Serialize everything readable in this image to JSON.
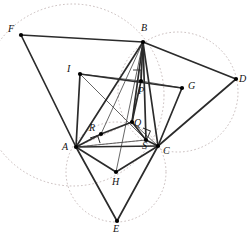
{
  "figure": {
    "background": "#ffffff",
    "stroke_solid": "#2b2b2b",
    "stroke_thin": "#4a4a4a",
    "stroke_dashed": "#b9a9a9",
    "vertex_fill": "#000000"
  },
  "points": [
    {
      "id": "F",
      "label": "F",
      "x": 21,
      "y": 35,
      "lx": 8,
      "ly": 24,
      "dot": true
    },
    {
      "id": "B",
      "label": "B",
      "x": 143,
      "y": 42,
      "lx": 141,
      "ly": 23,
      "dot": true
    },
    {
      "id": "D",
      "label": "D",
      "x": 236,
      "y": 79,
      "lx": 239,
      "ly": 74,
      "dot": true
    },
    {
      "id": "I",
      "label": "I",
      "x": 80,
      "y": 74,
      "lx": 67,
      "ly": 64,
      "dot": true
    },
    {
      "id": "G",
      "label": "G",
      "x": 182,
      "y": 88,
      "lx": 188,
      "ly": 81,
      "dot": true
    },
    {
      "id": "P",
      "label": "P",
      "x": 141,
      "y": 81,
      "lx": 138,
      "ly": 86,
      "dot": true
    },
    {
      "id": "Q",
      "label": "Q",
      "x": 132,
      "y": 122,
      "lx": 134,
      "ly": 118,
      "dot": true
    },
    {
      "id": "R",
      "label": "R",
      "x": 101,
      "y": 134,
      "lx": 89,
      "ly": 123,
      "dot": true
    },
    {
      "id": "S",
      "label": "S",
      "x": 146,
      "y": 140,
      "lx": 142,
      "ly": 141,
      "dot": true
    },
    {
      "id": "A",
      "label": "A",
      "x": 76,
      "y": 147,
      "lx": 62,
      "ly": 142,
      "dot": true
    },
    {
      "id": "C",
      "label": "C",
      "x": 158,
      "y": 146,
      "lx": 163,
      "ly": 146,
      "dot": true
    },
    {
      "id": "H",
      "label": "H",
      "x": 116,
      "y": 172,
      "lx": 112,
      "ly": 177,
      "dot": true
    },
    {
      "id": "E",
      "label": "E",
      "x": 117,
      "y": 221,
      "lx": 113,
      "ly": 224,
      "dot": true
    }
  ],
  "segments_thick": [
    {
      "name": "F-B",
      "from": "F",
      "to": "B"
    },
    {
      "name": "B-D",
      "from": "B",
      "to": "D"
    },
    {
      "name": "D-C",
      "from": "D",
      "to": "C"
    },
    {
      "name": "F-A",
      "from": "F",
      "to": "A"
    },
    {
      "name": "A-E",
      "from": "A",
      "to": "E"
    },
    {
      "name": "E-C",
      "from": "E",
      "to": "C"
    },
    {
      "name": "A-C",
      "from": "A",
      "to": "C"
    },
    {
      "name": "A-B",
      "from": "A",
      "to": "B"
    },
    {
      "name": "B-C",
      "from": "B",
      "to": "C"
    },
    {
      "name": "A-H",
      "from": "A",
      "to": "H"
    },
    {
      "name": "H-C",
      "from": "H",
      "to": "C"
    },
    {
      "name": "I-A",
      "from": "I",
      "to": "A"
    },
    {
      "name": "I-G",
      "from": "I",
      "to": "G"
    },
    {
      "name": "G-C",
      "from": "G",
      "to": "C"
    },
    {
      "name": "R-Q",
      "from": "R",
      "to": "Q"
    },
    {
      "name": "Q-S",
      "from": "Q",
      "to": "S"
    },
    {
      "name": "A-R",
      "from": "A",
      "to": "R"
    },
    {
      "name": "B-P",
      "from": "B",
      "to": "P"
    },
    {
      "name": "B-Q",
      "from": "B",
      "to": "Q"
    },
    {
      "name": "B-S",
      "from": "B",
      "to": "S"
    },
    {
      "name": "P-Q",
      "from": "P",
      "to": "Q"
    },
    {
      "name": "S-C",
      "from": "S",
      "to": "C"
    }
  ],
  "segments_thin": [
    {
      "name": "I-P",
      "from": "I",
      "to": "P"
    },
    {
      "name": "P-G",
      "from": "P",
      "to": "G"
    },
    {
      "name": "B-H",
      "from": "B",
      "to": "H"
    },
    {
      "name": "B-R",
      "from": "B",
      "to": "R"
    },
    {
      "name": "I-S",
      "from": "I",
      "to": "S"
    },
    {
      "name": "A-S",
      "from": "A",
      "to": "S"
    },
    {
      "name": "Q-C",
      "from": "Q",
      "to": "C"
    }
  ],
  "segments_dashed": [
    {
      "name": "A-Q-dashed",
      "from": "A",
      "to": "Q"
    },
    {
      "name": "Q-B-dashed",
      "from": "Q",
      "to": "B"
    },
    {
      "name": "A-S-dashed",
      "from": "A",
      "to": "S"
    }
  ],
  "circles": [
    {
      "name": "circumcircle-left-FAB",
      "cx": 73,
      "cy": 95,
      "r": 91
    },
    {
      "name": "circumcircle-right-BDC",
      "cx": 178,
      "cy": 92,
      "r": 60
    },
    {
      "name": "circumcircle-bottom-AEC",
      "cx": 116,
      "cy": 172,
      "r": 50
    }
  ],
  "right_angles": [
    {
      "name": "right-angle-at-P",
      "x": 133,
      "y": 70,
      "size": 8,
      "rot": 0
    },
    {
      "name": "right-angle-at-R",
      "x": 90,
      "y": 138,
      "size": 8,
      "rot": -18
    },
    {
      "name": "right-angle-at-S",
      "x": 143,
      "y": 128,
      "size": 8,
      "rot": 22
    }
  ]
}
